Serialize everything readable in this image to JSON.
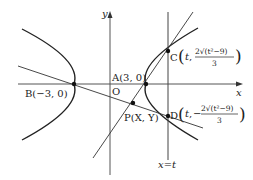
{
  "figure": {
    "axes": {
      "x_label": "x",
      "y_label": "y",
      "origin_label": "O"
    },
    "points": {
      "A": {
        "label": "A(3, 0)"
      },
      "B": {
        "label": "B(−3, 0)"
      },
      "C": {
        "name": "C",
        "coord_x": "t",
        "coord_y_num": "2√(t²−9)",
        "coord_y_den": "3"
      },
      "D": {
        "name": "D",
        "coord_x": "t",
        "coord_y_sign": "−",
        "coord_y_num": "2√(t²−9)",
        "coord_y_den": "3"
      },
      "P": {
        "label": "P(X, Y)"
      }
    },
    "line_label": "x=t",
    "colors": {
      "ink": "#222222",
      "axis": "#555555"
    }
  }
}
